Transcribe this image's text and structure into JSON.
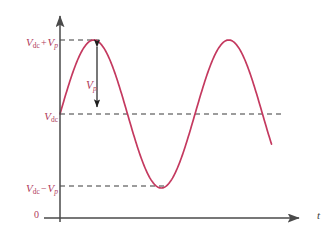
{
  "figure": {
    "axes": {
      "x_axis_label": "t",
      "origin_label": "0"
    },
    "annotations": {
      "peak_label": {
        "base": "V",
        "base_sub": "dc",
        "operator": "+",
        "term": "V",
        "term_sub": "p",
        "text": "Vdc + Vp"
      },
      "mid_label": {
        "base": "V",
        "base_sub": "dc",
        "text": "Vdc"
      },
      "trough_label": {
        "base": "V",
        "base_sub": "dc",
        "operator": "−",
        "term": "V",
        "term_sub": "p",
        "text": "Vdc − Vp"
      },
      "amplitude_label": {
        "base": "V",
        "base_sub": "p",
        "text": "Vp"
      }
    },
    "colors": {
      "curve": "#c4395f",
      "label": "#b03a5b",
      "axis": "#4a4a4a",
      "dashed": "#3a3a3a",
      "background": "#ffffff"
    }
  },
  "chart_data": {
    "type": "line",
    "title": "",
    "xlabel": "t",
    "ylabel": "",
    "grid": false,
    "legend": null,
    "axis_pixels": {
      "y_axis_x": 60,
      "x_axis_y": 218,
      "y_arrow_tip_y": 12,
      "x_arrow_tip_x": 305
    },
    "levels": [
      {
        "name": "Vdc + Vp",
        "y_px": 40,
        "dash_from_x": 60,
        "dash_to_x": 97
      },
      {
        "name": "Vdc",
        "y_px": 114,
        "dash_from_x": 60,
        "dash_to_x": 283
      },
      {
        "name": "Vdc − Vp",
        "y_px": 186,
        "dash_from_x": 60,
        "dash_to_x": 166
      }
    ],
    "waveform": {
      "form": "Vdc + Vp*sin(2*pi*t/T)",
      "start_x_px": 60,
      "end_x_px": 272,
      "period_px": 135,
      "amplitude_px": 74,
      "dc_offset_px": 114,
      "peaks_x_px": [
        97,
        232
      ],
      "troughs_x_px": [
        165
      ],
      "zero_crossings_x_px": [
        60,
        128,
        203,
        270
      ]
    },
    "amplitude_arrow": {
      "x_px": 97,
      "from_y_px": 42,
      "to_y_px": 112,
      "double_headed": true
    }
  }
}
